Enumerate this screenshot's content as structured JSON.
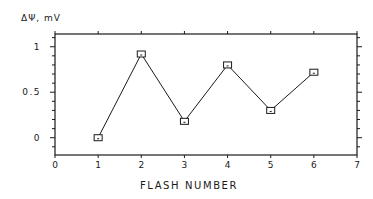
{
  "chart_data": {
    "type": "line",
    "title": "",
    "xlabel": "FLASH NUMBER",
    "ylabel": "ΔΨ, mV",
    "x": [
      1,
      2,
      3,
      4,
      5,
      6
    ],
    "series": [
      {
        "name": "ΔΨ",
        "values": [
          0.0,
          0.92,
          0.18,
          0.8,
          0.3,
          0.72
        ],
        "marker": "square",
        "color": "#1a1a1a"
      }
    ],
    "xlim": [
      0,
      7
    ],
    "ylim": [
      -0.19,
      1.14
    ],
    "xticks": [
      0,
      1,
      2,
      3,
      4,
      5,
      6,
      7
    ],
    "xtick_labels": [
      "0",
      "1",
      "2",
      "3",
      "4",
      "5",
      "6",
      "7"
    ],
    "yticks": [
      0,
      0.5,
      1
    ],
    "ytick_labels": [
      "0",
      "0.5",
      "1"
    ],
    "y_minor_tick_step": 0.1,
    "grid": false,
    "legend": null,
    "frame": "box"
  }
}
